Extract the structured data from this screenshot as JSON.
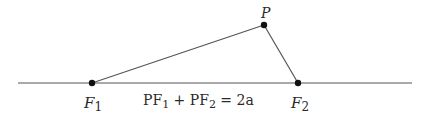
{
  "diagram": {
    "colors": {
      "line": "#555555",
      "point": "#111111",
      "text": "#2a2a2a"
    },
    "axis": {
      "x1": 18,
      "y1": 83,
      "x2": 412,
      "y2": 83
    },
    "points": [
      {
        "id": "F1",
        "label": "F",
        "sub": "1",
        "x": 92,
        "y": 83,
        "label_x": 84,
        "label_y": 108
      },
      {
        "id": "P",
        "label": "P",
        "sub": "",
        "x": 264,
        "y": 25,
        "label_x": 261,
        "label_y": 18
      },
      {
        "id": "F2",
        "label": "F",
        "sub": "2",
        "x": 298,
        "y": 83,
        "label_x": 291,
        "label_y": 108
      }
    ],
    "segments": [
      {
        "from": "F1",
        "to": "P"
      },
      {
        "from": "P",
        "to": "F2"
      }
    ],
    "equation": {
      "part1": "PF",
      "sub1": "1",
      "plus": " + PF",
      "sub2": "2",
      "rest": " = 2a"
    }
  }
}
